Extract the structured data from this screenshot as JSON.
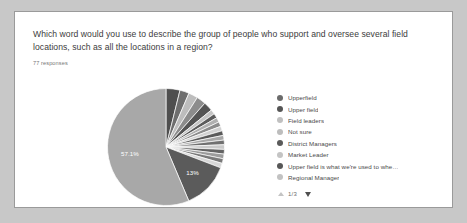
{
  "card": {
    "question": "Which word would you use to describe the group of people who support and oversee several field locations, such as all the locations in a region?",
    "response_count": "77 responses"
  },
  "legend": {
    "pager_text": "1/3",
    "up_icon": "triangle-up-icon",
    "down_icon": "triangle-down-icon"
  },
  "colors": {
    "card_background": "#ffffff",
    "page_background": "#c8c8c8",
    "card_border": "#9a9a9a",
    "title_text": "#3c3c3c",
    "subtitle_text": "#777777",
    "legend_text": "#4a4a4a",
    "slice_light": "#a8a8a8",
    "slice_dark": "#4f4f4f",
    "slice_mid": "#8c8c8c",
    "slice_label": "#ffffff"
  },
  "chart_data": {
    "type": "pie",
    "title": "Which word would you use to describe the group of people who support and oversee several field locations, such as all the locations in a region?",
    "subtitle": "77 responses",
    "total_responses": 77,
    "legend_position": "right",
    "grid": false,
    "labels_shown": [
      "57.1%",
      "13%"
    ],
    "categories": [
      "Upperfield",
      "Upper field",
      "Field leaders",
      "Not sure",
      "District Managers",
      "Market Leader",
      "Upper field is what we're used to whe…",
      "Regional Manager"
    ],
    "slices": [
      {
        "label": "Upperfield",
        "value": 3.9,
        "display": "",
        "color": "#4f4f4f"
      },
      {
        "label": "Upper field",
        "value": 2.6,
        "display": "",
        "color": "#6e6e6e"
      },
      {
        "label": "Field leaders",
        "value": 2.6,
        "display": "",
        "color": "#bdbdbd"
      },
      {
        "label": "Not sure",
        "value": 2.6,
        "display": "",
        "color": "#8c8c8c"
      },
      {
        "label": "District Managers",
        "value": 2.6,
        "display": "",
        "color": "#545454"
      },
      {
        "label": "Market Leader",
        "value": 1.3,
        "display": "",
        "color": "#c4c4c4"
      },
      {
        "label": "Upper field is what we're used to whe…",
        "value": 1.3,
        "display": "",
        "color": "#5c5c5c"
      },
      {
        "label": "Regional Manager",
        "value": 1.3,
        "display": "",
        "color": "#b0b0b0"
      },
      {
        "label": "other-1",
        "value": 1.3,
        "display": "",
        "color": "#8c8c8c"
      },
      {
        "label": "other-2",
        "value": 1.3,
        "display": "",
        "color": "#d2d2d2"
      },
      {
        "label": "other-3",
        "value": 1.3,
        "display": "",
        "color": "#5a5a5a"
      },
      {
        "label": "other-4",
        "value": 1.3,
        "display": "",
        "color": "#a8a8a8"
      },
      {
        "label": "other-5",
        "value": 1.3,
        "display": "",
        "color": "#707070"
      },
      {
        "label": "other-6",
        "value": 1.3,
        "display": "",
        "color": "#cacaca"
      },
      {
        "label": "other-7",
        "value": 1.3,
        "display": "",
        "color": "#636363"
      },
      {
        "label": "other-8",
        "value": 1.3,
        "display": "",
        "color": "#9c9c9c"
      },
      {
        "label": "other-9",
        "value": 1.3,
        "display": "",
        "color": "#7a7a7a"
      },
      {
        "label": "other-10",
        "value": 1.3,
        "display": "",
        "color": "#d8d8d8"
      },
      {
        "label": "thirteen-percent",
        "value": 13.0,
        "display": "13%",
        "color": "#5b5b5b"
      },
      {
        "label": "majority",
        "value": 57.1,
        "display": "57.1%",
        "color": "#a8a8a8"
      }
    ]
  },
  "legend_items": [
    {
      "label": "Upperfield",
      "color": "#6b6b6b"
    },
    {
      "label": "Upper field",
      "color": "#555555"
    },
    {
      "label": "Field leaders",
      "color": "#c0c0c0"
    },
    {
      "label": "Not sure",
      "color": "#bdbdbd"
    },
    {
      "label": "District Managers",
      "color": "#5a5a5a"
    },
    {
      "label": "Market Leader",
      "color": "#c4c4c4"
    },
    {
      "label": "Upper field is what we're used to whe…",
      "color": "#575757"
    },
    {
      "label": "Regional Manager",
      "color": "#c2c2c2"
    }
  ]
}
